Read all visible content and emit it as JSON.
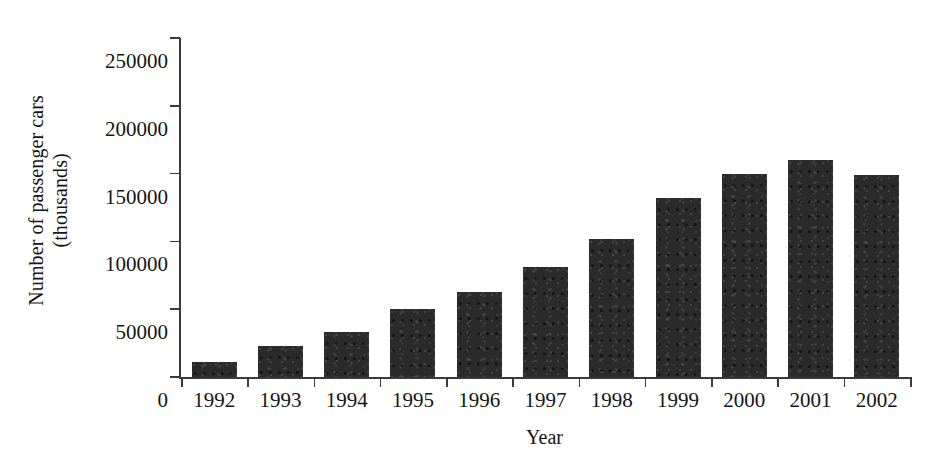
{
  "chart_data": {
    "type": "bar",
    "title": "",
    "xlabel": "Year",
    "ylabel": "Number of passenger cars (thousands)",
    "ylabel_lines": [
      "Number of passenger cars",
      "(thousands)"
    ],
    "categories": [
      "1992",
      "1993",
      "1994",
      "1995",
      "1996",
      "1997",
      "1998",
      "1999",
      "2000",
      "2001",
      "2002"
    ],
    "values": [
      11000,
      23000,
      33000,
      50000,
      63000,
      81000,
      102000,
      132000,
      150000,
      160000,
      149000
    ],
    "series": [
      {
        "name": "Number of passenger cars (thousands)",
        "values": [
          11000,
          23000,
          33000,
          50000,
          63000,
          81000,
          102000,
          132000,
          150000,
          160000,
          149000
        ]
      }
    ],
    "ylim": [
      0,
      250000
    ],
    "xlim_categories": 11,
    "ytick_values": [
      0,
      50000,
      100000,
      150000,
      200000,
      250000
    ],
    "ytick_labels": [
      "0",
      "50000",
      "100000",
      "150000",
      "200000",
      "250000"
    ],
    "grid": false,
    "legend": false,
    "legend_position": "none",
    "bar_color": "#2b2b2b",
    "axis_color": "#3b3b3b",
    "background_color": "#ffffff"
  }
}
